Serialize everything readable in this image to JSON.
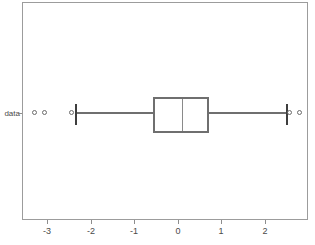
{
  "figure": {
    "width": 315,
    "height": 245,
    "background": "#ffffff",
    "title_remnant": "",
    "frame_color": "#9c9c9c"
  },
  "axes": {
    "y_category_label": "data",
    "x_ticks": [
      {
        "label": "-3",
        "value": -3,
        "px": 47
      },
      {
        "label": "-2",
        "value": -2,
        "px": 91
      },
      {
        "label": "-1",
        "value": -1,
        "px": 134
      },
      {
        "label": "0",
        "value": 0,
        "px": 178
      },
      {
        "label": "1",
        "value": 1,
        "px": 221
      },
      {
        "label": "2",
        "value": 2,
        "px": 265
      }
    ],
    "x_min": -3.6,
    "x_max": 2.99,
    "grid": false,
    "legend": "none"
  },
  "chart_data": {
    "type": "box",
    "orientation": "horizontal",
    "title": "",
    "xlabel": "",
    "ylabel": "data",
    "categories": [
      "data"
    ],
    "grid": false,
    "legend_position": "none",
    "xlim": [
      -3.6,
      2.99
    ],
    "tick_labels": [
      "-3",
      "-2",
      "-1",
      "0",
      "1",
      "2"
    ],
    "boxes": [
      {
        "name": "data",
        "whisker_low": -2.39,
        "q1": -0.6,
        "median": 0.07,
        "q3": 0.69,
        "whisker_high": 2.46,
        "iqr": 1.29,
        "outliers": [
          -3.29,
          -3.06,
          -2.46,
          2.55,
          2.78
        ]
      }
    ],
    "colors": {
      "box_edge": "#6f6f6f",
      "median": "#8a8a8a",
      "whisker": "#6f6f6f",
      "cap": "#3e3e3e",
      "outlier_edge": "#6b6b6b",
      "frame": "#9c9c9c",
      "text": "#4a4a4a"
    }
  },
  "geometry": {
    "frame": {
      "left": 22,
      "top": 2,
      "width": 286,
      "height": 218
    },
    "center_y": 112,
    "box": {
      "left": 152,
      "right": 208,
      "top": 96,
      "bottom": 132,
      "median_x": 181
    },
    "whisker_left_x": 74,
    "whisker_right_x": 285,
    "cap_top": 103,
    "cap_height": 21,
    "outliers_px": [
      35,
      45,
      71,
      289,
      299
    ]
  }
}
